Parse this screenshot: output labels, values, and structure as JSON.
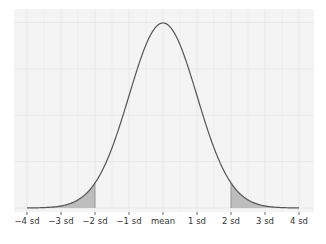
{
  "chart_data": {
    "type": "area",
    "title": "",
    "xlabel": "",
    "ylabel": "",
    "distribution": "standard normal density",
    "x_range": [
      -4.3,
      4.5
    ],
    "xlim": [
      -4,
      4
    ],
    "ylim": [
      0,
      0.41
    ],
    "grid": true,
    "legend": "none",
    "x_ticks": [
      {
        "value": -4,
        "label": "−4 sd"
      },
      {
        "value": -3,
        "label": "−3 sd"
      },
      {
        "value": -2,
        "label": "−2 sd"
      },
      {
        "value": -1,
        "label": "−1 sd"
      },
      {
        "value": 0,
        "label": "mean"
      },
      {
        "value": 1,
        "label": "1 sd"
      },
      {
        "value": 2,
        "label": "2 sd"
      },
      {
        "value": 3,
        "label": "3 sd"
      },
      {
        "value": 4,
        "label": "4 sd"
      }
    ],
    "series": [
      {
        "name": "normal curve",
        "x": [
          -4,
          -3,
          -2,
          -1,
          0,
          1,
          2,
          3,
          4
        ],
        "y": [
          0.0001,
          0.0044,
          0.054,
          0.242,
          0.399,
          0.242,
          0.054,
          0.0044,
          0.0001
        ]
      }
    ],
    "shaded_regions": [
      {
        "name": "left tail",
        "from": -4,
        "to": -2
      },
      {
        "name": "right tail",
        "from": 2,
        "to": 4
      }
    ],
    "colors": {
      "panel_background": "#f4f4f4",
      "grid": "#e6e6e6",
      "curve": "#555555",
      "shade": "#bdbdbd",
      "text": "#333333"
    }
  }
}
